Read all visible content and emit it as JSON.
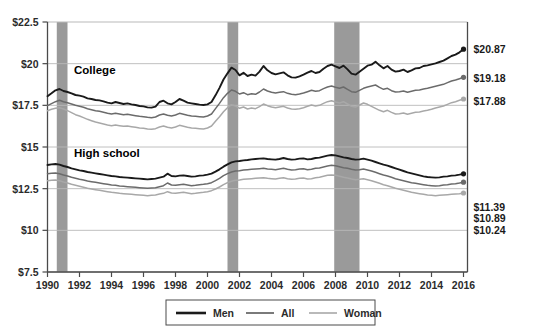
{
  "chart_data": {
    "type": "line",
    "title": "",
    "subtitle": "",
    "xlabel": "",
    "ylabel": "",
    "xlim": [
      1990,
      2016.25
    ],
    "ylim": [
      7.5,
      22.5
    ],
    "grid": true,
    "legend_position": "bottom",
    "y_ticks": [
      "$22.5",
      "$20",
      "$17.5",
      "$15",
      "$12.5",
      "$10",
      "$7.5"
    ],
    "y_tick_values": [
      22.5,
      20,
      17.5,
      15,
      12.5,
      10,
      7.5
    ],
    "x_ticks": [
      "1990",
      "1992",
      "1994",
      "1996",
      "1998",
      "2000",
      "2002",
      "2004",
      "2006",
      "2008",
      "2010",
      "2012",
      "2014",
      "2016"
    ],
    "x_tick_values": [
      1990,
      1992,
      1994,
      1996,
      1998,
      2000,
      2002,
      2004,
      2006,
      2008,
      2010,
      2012,
      2014,
      2016
    ],
    "group_labels": [
      {
        "key": "college",
        "text": "College"
      },
      {
        "key": "highschool",
        "text": "High school"
      }
    ],
    "legend": [
      {
        "key": "men",
        "label": "Men",
        "color": "#1a1a1a"
      },
      {
        "key": "all",
        "label": "All",
        "color": "#6b6b6b"
      },
      {
        "key": "woman",
        "label": "Woman",
        "color": "#a8a8a8"
      }
    ],
    "recession_bands": [
      {
        "start": 1990.58,
        "end": 1991.25,
        "color": "#9a9a9a"
      },
      {
        "start": 2001.25,
        "end": 2001.92,
        "color": "#9a9a9a"
      },
      {
        "start": 2007.92,
        "end": 2009.5,
        "color": "#9a9a9a"
      }
    ],
    "end_labels": [
      {
        "key": "college-men",
        "text": "$20.87",
        "value": 20.87
      },
      {
        "key": "college-all",
        "text": "$19.18",
        "value": 19.18
      },
      {
        "key": "college-woman",
        "text": "$17.88",
        "value": 17.88
      },
      {
        "key": "highschool-men",
        "text": "$11.39",
        "value": 11.39
      },
      {
        "key": "highschool-all",
        "text": "$10.89",
        "value": 10.89
      },
      {
        "key": "highschool-woman",
        "text": "$10.24",
        "value": 10.24
      }
    ],
    "x": [
      1990.0,
      1990.25,
      1990.5,
      1990.75,
      1991.0,
      1991.25,
      1991.5,
      1991.75,
      1992.0,
      1992.25,
      1992.5,
      1992.75,
      1993.0,
      1993.25,
      1993.5,
      1993.75,
      1994.0,
      1994.25,
      1994.5,
      1994.75,
      1995.0,
      1995.25,
      1995.5,
      1995.75,
      1996.0,
      1996.25,
      1996.5,
      1996.75,
      1997.0,
      1997.25,
      1997.5,
      1997.75,
      1998.0,
      1998.25,
      1998.5,
      1998.75,
      1999.0,
      1999.25,
      1999.5,
      1999.75,
      2000.0,
      2000.25,
      2000.5,
      2000.75,
      2001.0,
      2001.25,
      2001.5,
      2001.75,
      2002.0,
      2002.25,
      2002.5,
      2002.75,
      2003.0,
      2003.25,
      2003.5,
      2003.75,
      2004.0,
      2004.25,
      2004.5,
      2004.75,
      2005.0,
      2005.25,
      2005.5,
      2005.75,
      2006.0,
      2006.25,
      2006.5,
      2006.75,
      2007.0,
      2007.25,
      2007.5,
      2007.75,
      2008.0,
      2008.25,
      2008.5,
      2008.75,
      2009.0,
      2009.25,
      2009.5,
      2009.75,
      2010.0,
      2010.25,
      2010.5,
      2010.75,
      2011.0,
      2011.25,
      2011.5,
      2011.75,
      2012.0,
      2012.25,
      2012.5,
      2012.75,
      2013.0,
      2013.25,
      2013.5,
      2013.75,
      2014.0,
      2014.25,
      2014.5,
      2014.75,
      2015.0,
      2015.25,
      2015.5,
      2015.75,
      2016.0
    ],
    "series": [
      {
        "name": "Men",
        "group": "College",
        "color": "#1a1a1a",
        "values": [
          18.05,
          18.22,
          18.4,
          18.48,
          18.36,
          18.3,
          18.22,
          18.12,
          18.08,
          18.02,
          17.92,
          17.88,
          17.82,
          17.8,
          17.74,
          17.66,
          17.62,
          17.7,
          17.64,
          17.58,
          17.62,
          17.56,
          17.52,
          17.46,
          17.44,
          17.38,
          17.36,
          17.42,
          17.7,
          17.78,
          17.62,
          17.56,
          17.7,
          17.88,
          17.78,
          17.66,
          17.62,
          17.58,
          17.54,
          17.52,
          17.56,
          17.7,
          18.1,
          18.55,
          19.05,
          19.42,
          19.76,
          19.62,
          19.3,
          19.45,
          19.26,
          19.34,
          19.28,
          19.52,
          19.86,
          19.6,
          19.44,
          19.36,
          19.42,
          19.48,
          19.3,
          19.18,
          19.16,
          19.24,
          19.34,
          19.46,
          19.56,
          19.44,
          19.5,
          19.7,
          19.86,
          19.94,
          19.84,
          19.74,
          19.88,
          19.66,
          19.4,
          19.34,
          19.52,
          19.7,
          19.88,
          19.94,
          20.12,
          19.9,
          19.72,
          19.86,
          19.64,
          19.52,
          19.56,
          19.64,
          19.5,
          19.6,
          19.72,
          19.74,
          19.86,
          19.9,
          19.96,
          20.02,
          20.1,
          20.18,
          20.32,
          20.46,
          20.54,
          20.68,
          20.87
        ]
      },
      {
        "name": "All",
        "group": "College",
        "color": "#6b6b6b",
        "values": [
          17.48,
          17.6,
          17.72,
          17.8,
          17.72,
          17.66,
          17.58,
          17.5,
          17.44,
          17.38,
          17.3,
          17.24,
          17.18,
          17.14,
          17.08,
          17.02,
          16.98,
          17.02,
          16.98,
          16.94,
          16.96,
          16.92,
          16.88,
          16.84,
          16.82,
          16.78,
          16.76,
          16.8,
          16.92,
          16.98,
          16.9,
          16.86,
          16.92,
          17.02,
          16.96,
          16.9,
          16.86,
          16.84,
          16.82,
          16.8,
          16.86,
          16.98,
          17.3,
          17.62,
          17.96,
          18.22,
          18.42,
          18.34,
          18.18,
          18.26,
          18.14,
          18.2,
          18.16,
          18.3,
          18.48,
          18.36,
          18.28,
          18.24,
          18.28,
          18.32,
          18.22,
          18.16,
          18.14,
          18.18,
          18.24,
          18.32,
          18.4,
          18.34,
          18.38,
          18.5,
          18.6,
          18.66,
          18.58,
          18.52,
          18.6,
          18.46,
          18.32,
          18.28,
          18.4,
          18.52,
          18.6,
          18.66,
          18.72,
          18.58,
          18.46,
          18.52,
          18.38,
          18.3,
          18.32,
          18.36,
          18.28,
          18.34,
          18.4,
          18.42,
          18.48,
          18.52,
          18.58,
          18.64,
          18.7,
          18.76,
          18.86,
          18.96,
          19.02,
          19.1,
          19.18
        ]
      },
      {
        "name": "Woman",
        "group": "College",
        "color": "#a8a8a8",
        "values": [
          17.18,
          17.26,
          17.32,
          17.36,
          17.28,
          17.18,
          17.06,
          16.94,
          16.86,
          16.76,
          16.66,
          16.58,
          16.5,
          16.44,
          16.38,
          16.32,
          16.28,
          16.32,
          16.28,
          16.24,
          16.26,
          16.22,
          16.18,
          16.14,
          16.12,
          16.08,
          16.06,
          16.1,
          16.2,
          16.26,
          16.18,
          16.14,
          16.2,
          16.3,
          16.24,
          16.18,
          16.14,
          16.12,
          16.1,
          16.08,
          16.14,
          16.26,
          16.54,
          16.82,
          17.12,
          17.36,
          17.54,
          17.46,
          17.32,
          17.4,
          17.28,
          17.34,
          17.3,
          17.42,
          17.58,
          17.48,
          17.4,
          17.36,
          17.4,
          17.44,
          17.34,
          17.28,
          17.26,
          17.3,
          17.36,
          17.44,
          17.52,
          17.46,
          17.5,
          17.62,
          17.72,
          17.78,
          17.7,
          17.64,
          17.72,
          17.58,
          17.44,
          17.4,
          17.52,
          17.64,
          17.56,
          17.44,
          17.32,
          17.2,
          17.12,
          17.2,
          17.08,
          16.98,
          17.0,
          17.04,
          16.96,
          17.02,
          17.08,
          17.1,
          17.16,
          17.2,
          17.26,
          17.34,
          17.4,
          17.46,
          17.56,
          17.66,
          17.72,
          17.8,
          17.88
        ]
      },
      {
        "name": "Men",
        "group": "High school",
        "color": "#1a1a1a",
        "values": [
          13.92,
          13.96,
          13.98,
          13.94,
          13.86,
          13.8,
          13.72,
          13.66,
          13.6,
          13.56,
          13.5,
          13.46,
          13.42,
          13.38,
          13.34,
          13.3,
          13.26,
          13.24,
          13.2,
          13.18,
          13.16,
          13.14,
          13.12,
          13.1,
          13.08,
          13.06,
          13.08,
          13.1,
          13.16,
          13.22,
          13.4,
          13.26,
          13.24,
          13.28,
          13.3,
          13.26,
          13.22,
          13.24,
          13.28,
          13.3,
          13.34,
          13.4,
          13.52,
          13.66,
          13.82,
          13.96,
          14.08,
          14.14,
          14.16,
          14.2,
          14.22,
          14.26,
          14.28,
          14.3,
          14.32,
          14.28,
          14.26,
          14.24,
          14.28,
          14.34,
          14.28,
          14.24,
          14.26,
          14.3,
          14.32,
          14.26,
          14.28,
          14.34,
          14.36,
          14.42,
          14.48,
          14.52,
          14.5,
          14.44,
          14.38,
          14.34,
          14.28,
          14.24,
          14.26,
          14.3,
          14.24,
          14.18,
          14.1,
          14.02,
          13.94,
          13.88,
          13.8,
          13.72,
          13.64,
          13.56,
          13.48,
          13.42,
          13.36,
          13.3,
          13.24,
          13.2,
          13.18,
          13.16,
          13.18,
          13.22,
          13.24,
          13.28,
          13.3,
          13.34,
          13.39
        ]
      },
      {
        "name": "All",
        "group": "High school",
        "color": "#6b6b6b",
        "values": [
          13.4,
          13.42,
          13.44,
          13.4,
          13.32,
          13.26,
          13.18,
          13.12,
          13.06,
          13.02,
          12.96,
          12.92,
          12.88,
          12.84,
          12.8,
          12.76,
          12.72,
          12.7,
          12.66,
          12.64,
          12.62,
          12.6,
          12.58,
          12.56,
          12.54,
          12.52,
          12.54,
          12.56,
          12.62,
          12.68,
          12.84,
          12.72,
          12.7,
          12.74,
          12.76,
          12.72,
          12.68,
          12.7,
          12.74,
          12.76,
          12.8,
          12.86,
          12.98,
          13.12,
          13.28,
          13.4,
          13.5,
          13.56,
          13.58,
          13.62,
          13.64,
          13.66,
          13.68,
          13.7,
          13.72,
          13.68,
          13.66,
          13.64,
          13.68,
          13.72,
          13.66,
          13.62,
          13.64,
          13.68,
          13.7,
          13.64,
          13.66,
          13.72,
          13.74,
          13.8,
          13.86,
          13.9,
          13.88,
          13.82,
          13.76,
          13.72,
          13.66,
          13.62,
          13.64,
          13.68,
          13.62,
          13.56,
          13.48,
          13.4,
          13.32,
          13.26,
          13.18,
          13.1,
          13.04,
          12.98,
          12.92,
          12.86,
          12.82,
          12.78,
          12.74,
          12.7,
          12.68,
          12.66,
          12.68,
          12.72,
          12.74,
          12.78,
          12.8,
          12.84,
          12.89
        ]
      },
      {
        "name": "Woman",
        "group": "High school",
        "color": "#a8a8a8",
        "values": [
          12.98,
          13.0,
          13.02,
          12.98,
          12.9,
          12.84,
          12.76,
          12.7,
          12.64,
          12.58,
          12.52,
          12.48,
          12.44,
          12.4,
          12.36,
          12.32,
          12.28,
          12.26,
          12.22,
          12.2,
          12.18,
          12.16,
          12.14,
          12.12,
          12.1,
          12.08,
          12.1,
          12.12,
          12.18,
          12.22,
          12.32,
          12.24,
          12.22,
          12.26,
          12.28,
          12.24,
          12.2,
          12.22,
          12.26,
          12.28,
          12.32,
          12.38,
          12.48,
          12.6,
          12.74,
          12.86,
          12.94,
          13.0,
          13.02,
          13.06,
          13.08,
          13.1,
          13.12,
          13.14,
          13.16,
          13.12,
          13.1,
          13.08,
          13.12,
          13.16,
          13.1,
          13.06,
          13.08,
          13.12,
          13.14,
          13.08,
          13.1,
          13.16,
          13.18,
          13.24,
          13.3,
          13.32,
          13.3,
          13.24,
          13.18,
          13.14,
          13.08,
          13.04,
          13.06,
          13.1,
          13.04,
          12.98,
          12.9,
          12.82,
          12.74,
          12.68,
          12.6,
          12.52,
          12.46,
          12.4,
          12.34,
          12.28,
          12.24,
          12.2,
          12.16,
          12.12,
          12.1,
          12.08,
          12.1,
          12.12,
          12.14,
          12.16,
          12.18,
          12.2,
          12.24
        ]
      }
    ]
  }
}
